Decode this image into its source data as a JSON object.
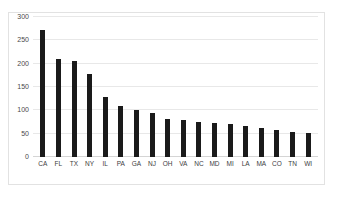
{
  "figure": {
    "caption": ""
  },
  "chart_data": {
    "type": "bar",
    "title": "",
    "xlabel": "",
    "ylabel": "",
    "ylim": [
      0,
      300
    ],
    "yticks": [
      0,
      50,
      100,
      150,
      200,
      250,
      300
    ],
    "grid": true,
    "legend": null,
    "bar_color": "#1a1a1a",
    "grid_color": "#e8e8e8",
    "categories": [
      "CA",
      "FL",
      "TX",
      "NY",
      "IL",
      "PA",
      "GA",
      "NJ",
      "OH",
      "VA",
      "NC",
      "MD",
      "MI",
      "LA",
      "MA",
      "CO",
      "TN",
      "WI"
    ],
    "values": [
      272,
      211,
      205,
      178,
      128,
      110,
      101,
      95,
      82,
      79,
      76,
      73,
      71,
      67,
      62,
      57,
      54,
      52
    ]
  }
}
